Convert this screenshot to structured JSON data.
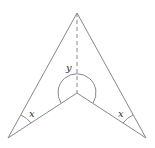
{
  "diagram": {
    "type": "arrowhead-concave-quadrilateral",
    "vertices": {
      "top": [
        77,
        13
      ],
      "bottom_left": [
        8,
        138
      ],
      "inner": [
        77,
        93
      ],
      "bottom_right": [
        146,
        138
      ]
    },
    "labels": {
      "y": "y",
      "x_left": "x",
      "x_right": "x"
    },
    "colors": {
      "stroke": "#888888",
      "text": "#333333"
    }
  }
}
